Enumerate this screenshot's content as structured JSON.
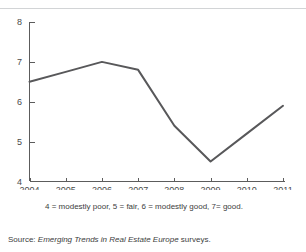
{
  "chart_data": {
    "type": "line",
    "title": "",
    "subtitle": "",
    "xlabel": "",
    "ylabel": "",
    "categories": [
      "2004",
      "2005",
      "2006",
      "2007",
      "2008",
      "2009",
      "2010",
      "2011"
    ],
    "x": [
      2004,
      2005,
      2006,
      2007,
      2008,
      2009,
      2010,
      2011
    ],
    "values": [
      6.5,
      6.75,
      7.0,
      6.8,
      5.4,
      4.5,
      5.2,
      5.9
    ],
    "series": [
      {
        "name": "Business profitability",
        "values": [
          6.5,
          6.75,
          7.0,
          6.8,
          5.4,
          4.5,
          5.2,
          5.9
        ],
        "color": "#58585a"
      }
    ],
    "ylim": [
      4,
      8
    ],
    "yticks": [
      4,
      5,
      6,
      7,
      8
    ],
    "ytick_labels": [
      "4",
      "5",
      "6",
      "7",
      "8"
    ],
    "xlim": [
      2004,
      2011
    ],
    "xticks": [
      2004,
      2005,
      2006,
      2007,
      2008,
      2009,
      2010,
      2011
    ],
    "xtick_labels": [
      "2004",
      "2005",
      "2006",
      "2007",
      "2008",
      "2009",
      "2010",
      "2011"
    ],
    "grid": false,
    "legend": false,
    "legend_position": "none",
    "markers": false,
    "annotations": []
  },
  "notes": {
    "scale_key": "4 = modestly poor, 5 = fair, 6 = modestly good, 7= good."
  },
  "source": {
    "label": "Source:",
    "publication": "Emerging Trends in Real Estate Europe",
    "tail": "surveys."
  },
  "colors": {
    "line": "#58585a",
    "axis": "#5c5c5c",
    "rule": "#d2d4d6",
    "text": "#3d3d3d",
    "background": "#ffffff"
  }
}
